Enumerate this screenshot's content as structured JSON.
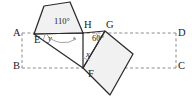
{
  "figure": {
    "colors": {
      "stroke": "#2b2b2b",
      "dashed_stroke": "#8c8c8c",
      "fill": "#f1f1f1",
      "arc": "#9a9a9a",
      "text": "#1b1b1b",
      "background": "#ffffff"
    },
    "rectangle": {
      "name": "ABCD",
      "corners": [
        {
          "label": "A",
          "x": 22,
          "y": 33
        },
        {
          "label": "D",
          "x": 176,
          "y": 33
        },
        {
          "label": "C",
          "x": 176,
          "y": 68
        },
        {
          "label": "B",
          "x": 22,
          "y": 68
        }
      ],
      "style": "dashed"
    },
    "points": [
      {
        "label": "A",
        "lx": 13,
        "ly": 28
      },
      {
        "label": "B",
        "lx": 13,
        "ly": 63
      },
      {
        "label": "C",
        "lx": 178,
        "ly": 63
      },
      {
        "label": "D",
        "lx": 178,
        "ly": 28
      },
      {
        "label": "E",
        "lx": 35,
        "ly": 36
      },
      {
        "label": "F",
        "lx": 91,
        "ly": 70
      },
      {
        "label": "G",
        "lx": 108,
        "ly": 22
      },
      {
        "label": "H",
        "lx": 86,
        "ly": 22
      }
    ],
    "angles": [
      {
        "label": "110°",
        "lx": 55,
        "ly": 20,
        "at": "H-interior-of-left-quadrilateral"
      },
      {
        "label": "y",
        "lx": 48,
        "ly": 36,
        "at": "E-between-EA-and-EH"
      },
      {
        "label": "60°",
        "lx": 94,
        "ly": 36,
        "at": "G-between-GH-and-GF"
      },
      {
        "label": "x",
        "lx": 88,
        "ly": 52,
        "at": "F-between-FH-and-FG"
      }
    ],
    "shapes": [
      {
        "name": "left-quadrilateral",
        "vertices": [
          [
            34,
            34
          ],
          [
            44,
            6
          ],
          [
            70,
            2
          ],
          [
            83,
            33
          ]
        ],
        "filled": true
      },
      {
        "name": "right-square",
        "vertices": [
          [
            105,
            31
          ],
          [
            133,
            54
          ],
          [
            110,
            95
          ],
          [
            83,
            68
          ]
        ],
        "filled": true
      },
      {
        "name": "triangle-EHF",
        "vertices": [
          [
            34,
            34
          ],
          [
            83,
            33
          ],
          [
            83,
            68
          ]
        ],
        "filled": false
      },
      {
        "name": "segment-HG",
        "vertices": [
          [
            83,
            33
          ],
          [
            105,
            31
          ]
        ],
        "filled": false
      }
    ]
  }
}
